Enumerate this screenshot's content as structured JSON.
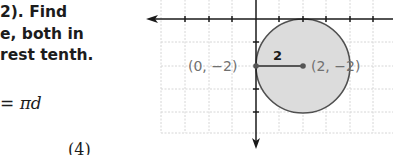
{
  "problem": {
    "lines": [
      "2). Find",
      "e, both in",
      "rest tenth."
    ]
  },
  "formula": {
    "eq_sign": "=",
    "pi": "π",
    "var": "d",
    "partial_next_line": "(4)"
  },
  "graph": {
    "point_a_label": "(0, −2)",
    "point_b_label": "(2, −2)",
    "radius_label": "2",
    "colors": {
      "circle_fill": "#dcdcdc",
      "circle_stroke": "#505050",
      "axis": "#1a1a1a",
      "grid": "#d6d6d6",
      "label": "#707070"
    }
  }
}
